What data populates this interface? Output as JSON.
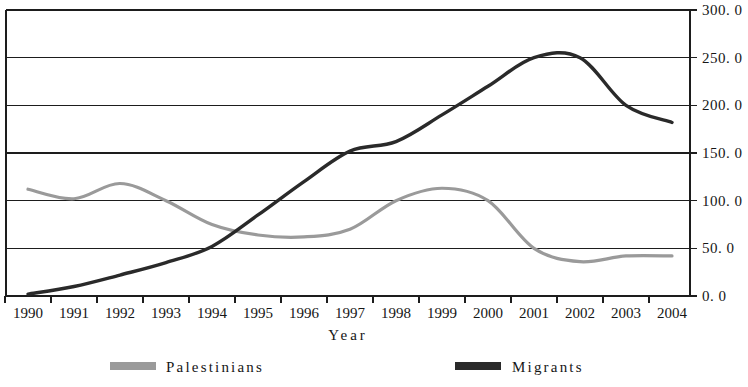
{
  "chart_data": {
    "type": "line",
    "title": "",
    "subtitle": "",
    "xlabel": "Year",
    "ylabel": "",
    "categories": [
      "1990",
      "1991",
      "1992",
      "1993",
      "1994",
      "1995",
      "1996",
      "1997",
      "1998",
      "1999",
      "2000",
      "2001",
      "2002",
      "2003",
      "2004"
    ],
    "x_tick_labels": [
      "1990",
      "1991",
      "1992",
      "1993",
      "1994",
      "1995",
      "1996",
      "1997",
      "1998",
      "1999",
      "2000",
      "2001",
      "2002",
      "2003",
      "2004"
    ],
    "y_tick_labels": [
      "0. 0",
      "50. 0",
      "100. 0",
      "150. 0",
      "200. 0",
      "250. 0",
      "300. 0"
    ],
    "y_tick_values": [
      0,
      50,
      100,
      150,
      200,
      250,
      300
    ],
    "ylim": [
      0,
      300
    ],
    "xlim": [
      "1990",
      "2004"
    ],
    "grid": "horizontal",
    "legend_position": "bottom",
    "y_axis_side": "right",
    "series": [
      {
        "name": "Palestinians",
        "color": "#9a9a9a",
        "stroke_width": 3.2,
        "values": [
          112,
          102,
          118,
          100,
          75,
          64,
          62,
          70,
          100,
          113,
          100,
          50,
          36,
          42,
          42
        ]
      },
      {
        "name": "Migrants",
        "color": "#2a2a2a",
        "stroke_width": 3.4,
        "values": [
          2,
          10,
          22,
          35,
          52,
          85,
          120,
          152,
          162,
          190,
          220,
          250,
          250,
          200,
          182
        ]
      }
    ],
    "legend": [
      {
        "label": "Palestinians",
        "color": "#9a9a9a"
      },
      {
        "label": "Migrants",
        "color": "#2a2a2a"
      }
    ]
  },
  "layout": {
    "plot_left": 6,
    "plot_right": 690,
    "plot_top": 10,
    "plot_bottom": 296,
    "first_year_x": 28,
    "last_year_x": 672
  }
}
